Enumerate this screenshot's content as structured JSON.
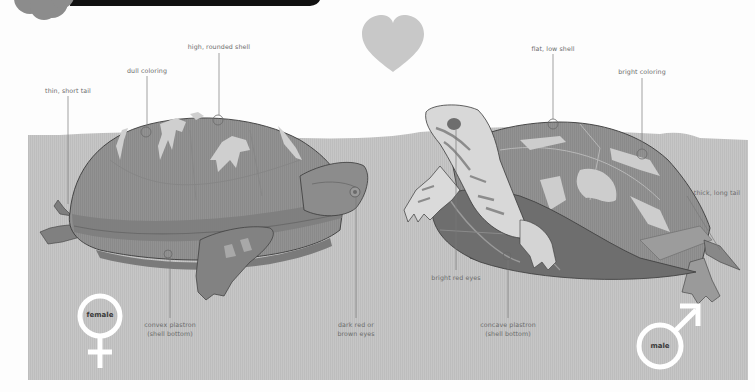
{
  "diagram": {
    "colors": {
      "background": "#fdfdfd",
      "ground": "#c4c4c4",
      "header_bar": "#111111",
      "header_badge": "#8c8c8c",
      "heart": "#c8c8c8",
      "shell_female": "#8f8f8f",
      "shell_male": "#8a8a8a",
      "outline": "#3a3a3a",
      "leader_line": "#7a7a7a",
      "symbol": "#ffffff"
    },
    "female": {
      "symbol_label": "female",
      "labels": {
        "tail": "thin, short tail",
        "coloring": "dull coloring",
        "shell": "high, rounded shell",
        "plastron_line1": "convex plastron",
        "plastron_line2": "(shell bottom)",
        "eyes_line1": "dark red or",
        "eyes_line2": "brown eyes"
      }
    },
    "male": {
      "symbol_label": "male",
      "labels": {
        "shell": "flat, low shell",
        "coloring": "bright coloring",
        "tail": "thick, long tail",
        "eyes": "bright red eyes",
        "plastron_line1": "concave plastron",
        "plastron_line2": "(shell bottom)"
      }
    },
    "icons": {
      "heart": "heart-icon",
      "female_symbol": "female-symbol-icon",
      "male_symbol": "male-symbol-icon",
      "header_badge": "badge-icon"
    }
  }
}
